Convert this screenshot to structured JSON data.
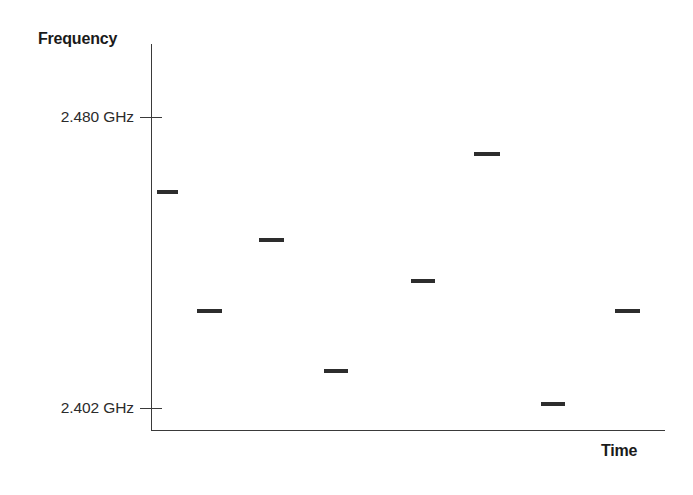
{
  "figure": {
    "background_color": "#ffffff",
    "ink_color": "#2d2d2d",
    "axis_color": "#3a3a3a"
  },
  "axes": {
    "y_title": "Frequency",
    "x_title": "Time",
    "y_ticks": [
      {
        "label": "2.480 GHz",
        "value": 2.48
      },
      {
        "label": "2.402 GHz",
        "value": 2.402
      }
    ]
  },
  "chart_data": {
    "type": "scatter",
    "title": "",
    "xlabel": "Time",
    "ylabel": "Frequency",
    "ylim": [
      2.402,
      2.48
    ],
    "y_tick_labels": [
      "2.402 GHz",
      "2.480 GHz"
    ],
    "y_tick_values": [
      2.402,
      2.48
    ],
    "x_tick_labels": [],
    "grid": false,
    "legend": null,
    "marker": "horizontal-dash",
    "units": "GHz",
    "x": [
      1,
      2,
      3,
      4,
      5,
      6,
      7,
      8
    ],
    "values": [
      2.46,
      2.428,
      2.447,
      2.412,
      2.436,
      2.47,
      2.403,
      2.428
    ],
    "points": [
      {
        "index": 1,
        "frequency_ghz": 2.46,
        "x_px_start": 157,
        "x_px_end": 178,
        "y_px": 191
      },
      {
        "index": 2,
        "frequency_ghz": 2.428,
        "x_px_start": 197,
        "x_px_end": 222,
        "y_px": 313
      },
      {
        "index": 3,
        "frequency_ghz": 2.447,
        "x_px_start": 259,
        "x_px_end": 284,
        "y_px": 240
      },
      {
        "index": 4,
        "frequency_ghz": 2.412,
        "x_px_start": 324,
        "x_px_end": 348,
        "y_px": 370
      },
      {
        "index": 5,
        "frequency_ghz": 2.436,
        "x_px_start": 411,
        "x_px_end": 435,
        "y_px": 280
      },
      {
        "index": 6,
        "frequency_ghz": 2.47,
        "x_px_start": 474,
        "x_px_end": 500,
        "y_px": 153
      },
      {
        "index": 7,
        "frequency_ghz": 2.403,
        "x_px_start": 541,
        "x_px_end": 565,
        "y_px": 403
      },
      {
        "index": 8,
        "frequency_ghz": 2.428,
        "x_px_start": 615,
        "x_px_end": 640,
        "y_px": 312
      }
    ]
  }
}
